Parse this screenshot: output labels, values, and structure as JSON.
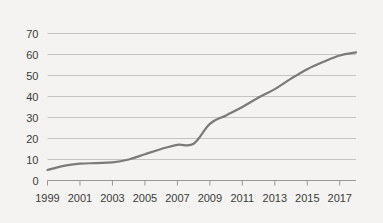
{
  "chart_data": {
    "type": "line",
    "title": "",
    "subtitle": "",
    "xlabel": "",
    "ylabel": "",
    "grid": "horizontal",
    "legend": "none",
    "xlim": [
      1999,
      2018
    ],
    "ylim": [
      0,
      70
    ],
    "y_ticks": [
      0,
      10,
      20,
      30,
      40,
      50,
      60,
      70
    ],
    "y_tick_labels": [
      "0",
      "10",
      "20",
      "30",
      "40",
      "50",
      "60",
      "70"
    ],
    "x_ticks": [
      1999,
      2001,
      2003,
      2005,
      2007,
      2009,
      2011,
      2013,
      2015,
      2017
    ],
    "x_tick_labels": [
      "1999",
      "2001",
      "2003",
      "2005",
      "2007",
      "2009",
      "2011",
      "2013",
      "2015",
      "2017"
    ],
    "x": [
      1999,
      2000,
      2001,
      2002,
      2003,
      2004,
      2005,
      2006,
      2007,
      2008,
      2009,
      2010,
      2011,
      2012,
      2013,
      2014,
      2015,
      2016,
      2017,
      2018
    ],
    "values": [
      5,
      7,
      8,
      8.3,
      8.6,
      10,
      12.5,
      15,
      17,
      17.5,
      27,
      31,
      35,
      39.5,
      43.5,
      48.5,
      53,
      56.5,
      59.5,
      61
    ],
    "series": [
      {
        "name": "series-1",
        "values": [
          5,
          7,
          8,
          8.3,
          8.6,
          10,
          12.5,
          15,
          17,
          17.5,
          27,
          31,
          35,
          39.5,
          43.5,
          48.5,
          53,
          56.5,
          59.5,
          61
        ]
      }
    ],
    "colors": {
      "line": "#7c7a78",
      "grid": "#b9b7b4",
      "axis": "#8e8c89",
      "text": "#3b3b3b",
      "background": "#f4f3f1"
    }
  }
}
